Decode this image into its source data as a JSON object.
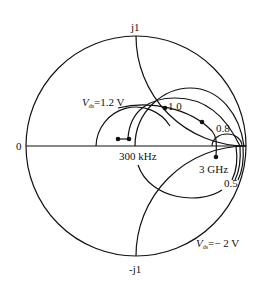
{
  "diagram": {
    "type": "smith-chart",
    "labels": {
      "top": "j1",
      "bottom": "-j1",
      "left": "0",
      "bias_high": {
        "var": "V",
        "sub": "ds",
        "value": "=1.2 V"
      },
      "bias_low": {
        "var": "V",
        "sub": "ds",
        "value": "=− 2 V"
      },
      "freq_low": "300 kHz",
      "freq_high": "3 GHz",
      "mark_1_0": "1.0",
      "mark_0_8": "0.8",
      "mark_0_5": "0.5"
    },
    "colors": {
      "line": "#111111",
      "background": "#ffffff"
    }
  }
}
